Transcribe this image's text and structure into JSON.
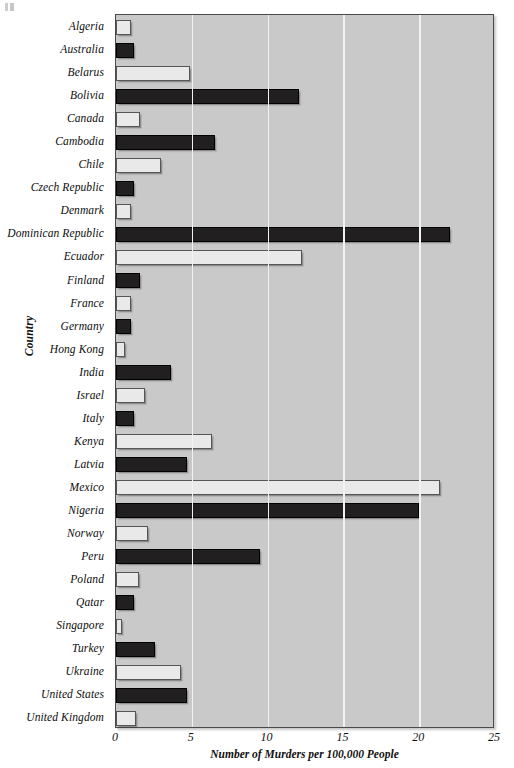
{
  "chart_data": {
    "type": "bar",
    "orientation": "horizontal",
    "title": "",
    "xlabel": "Number of Murders per 100,000 People",
    "ylabel": "Country",
    "xlim": [
      0,
      25
    ],
    "xticks": [
      0,
      5,
      10,
      15,
      20,
      25
    ],
    "grid": "vertical white gridlines at each x tick",
    "legend": "none",
    "plot_background": "#c9c9c9",
    "bar_colors": {
      "dark": "#211f1f",
      "light": "#e9e9e9"
    },
    "bar_color_pattern": "alternating light and dark by row",
    "categories": [
      "Algeria",
      "Australia",
      "Belarus",
      "Bolivia",
      "Canada",
      "Cambodia",
      "Chile",
      "Czech Republic",
      "Denmark",
      "Dominican Republic",
      "Ecuador",
      "Finland",
      "France",
      "Germany",
      "Hong Kong",
      "India",
      "Israel",
      "Italy",
      "Kenya",
      "Latvia",
      "Mexico",
      "Nigeria",
      "Norway",
      "Peru",
      "Poland",
      "Qatar",
      "Singapore",
      "Turkey",
      "Ukraine",
      "United States",
      "United Kingdom"
    ],
    "values": [
      1.0,
      1.2,
      4.9,
      12.1,
      1.6,
      6.5,
      3.0,
      1.2,
      1.0,
      22.0,
      12.3,
      1.6,
      1.0,
      1.0,
      0.6,
      3.6,
      1.9,
      1.2,
      6.3,
      4.7,
      21.4,
      20.0,
      2.1,
      9.5,
      1.5,
      1.2,
      0.4,
      2.6,
      4.3,
      4.7,
      1.3
    ],
    "shades": [
      "light",
      "dark",
      "light",
      "dark",
      "light",
      "dark",
      "light",
      "dark",
      "light",
      "dark",
      "light",
      "dark",
      "light",
      "dark",
      "light",
      "dark",
      "light",
      "dark",
      "light",
      "dark",
      "light",
      "dark",
      "light",
      "dark",
      "light",
      "dark",
      "light",
      "dark",
      "light",
      "dark",
      "light"
    ]
  }
}
